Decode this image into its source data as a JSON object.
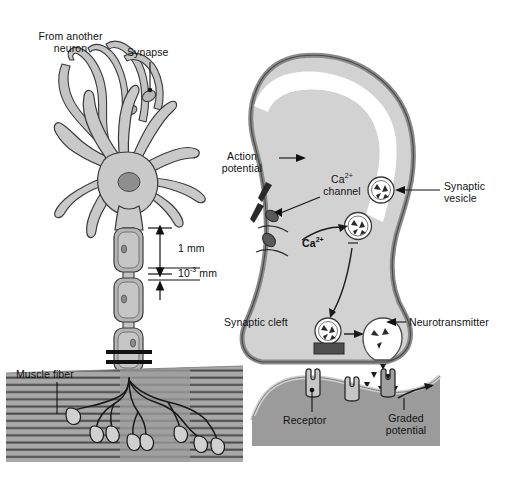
{
  "figure": {
    "background": "#ffffff",
    "palette": {
      "outline": "#3a3a3a",
      "cell_fill": "#c9c9c9",
      "terminal_fill": "#d2d2d2",
      "terminal_edge": "#9a9a9a",
      "nucleus": "#8e8e8e",
      "myelin_fill": "#b5b5b5",
      "muscle_band": "#a8a8a8",
      "muscle_stripe": "#4a4a4a",
      "receptor_membrane": "#9b9b9b",
      "active_zone": "#4f4f4f",
      "channel": "#5a5a5a",
      "text": "#111111"
    }
  },
  "labels": {
    "from_another_neuron_line1": "From another",
    "from_another_neuron_line2": "neuron",
    "synapse": "Synapse",
    "scale_1mm": "1 mm",
    "scale_10e3mm_base": "10",
    "scale_10e3mm_exp": "-3",
    "scale_10e3mm_unit": " mm",
    "muscle_fiber": "Muscle fiber",
    "action_line1": "Action",
    "action_line2": "potential",
    "ca_channel_line1_base": "Ca",
    "ca_channel_line1_exp": "2+",
    "ca_channel_line2": "channel",
    "ca_ion_base": "Ca",
    "ca_ion_exp": "2+",
    "synaptic_vesicle_line1": "Synaptic",
    "synaptic_vesicle_line2": "vesicle",
    "synaptic_cleft": "Synaptic cleft",
    "neurotransmitter": "Neurotransmitter",
    "receptor": "Receptor",
    "graded_line1": "Graded",
    "graded_line2": "potential"
  }
}
